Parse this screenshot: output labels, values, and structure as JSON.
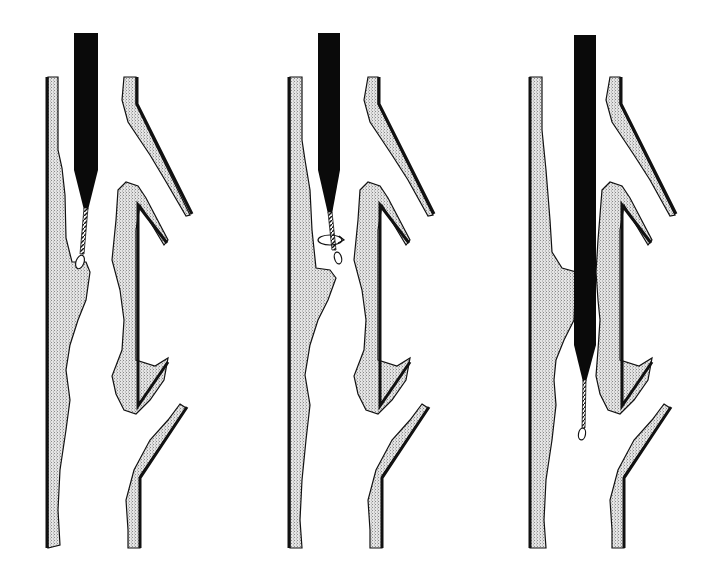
{
  "figure": {
    "panels": [
      {
        "id": "panel-1",
        "stage": "catheter above lesion, guidewire tip engaging plaque"
      },
      {
        "id": "panel-2",
        "stage": "guidewire rotating (rotation arrow) to cross lesion"
      },
      {
        "id": "panel-3",
        "stage": "catheter advanced through lesion, guidewire distal"
      }
    ],
    "colors": {
      "wall": "#111111",
      "plaque_fill": "#d8d8d8",
      "catheter": "#0a0a0a",
      "background": "#ffffff"
    }
  }
}
